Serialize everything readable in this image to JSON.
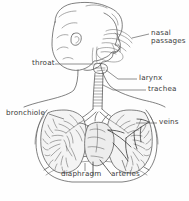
{
  "figure": {
    "style": "pencil line drawing",
    "background_color": "#fefefe",
    "ink_color": "#4a4a4a",
    "label_color": "#3a3a3a",
    "caption": ""
  },
  "labels": {
    "nasal_passages": "nasal\npassages",
    "nasal_passages_line1": "nasal",
    "nasal_passages_line2": "passages",
    "throat": "throat",
    "larynx": "larynx",
    "trachea": "trachea",
    "bronchiole": "bronchiole",
    "veins": "veins",
    "diaphragm": "diaphragm",
    "arteries": "arteries"
  },
  "parts": [
    {
      "id": "nasal-passages",
      "label": "nasal passages",
      "side": "right",
      "x": 152,
      "y": 34
    },
    {
      "id": "throat",
      "label": "throat",
      "side": "left",
      "x": 30,
      "y": 62
    },
    {
      "id": "larynx",
      "label": "larynx",
      "side": "right",
      "x": 140,
      "y": 77
    },
    {
      "id": "trachea",
      "label": "trachea",
      "side": "right",
      "x": 149,
      "y": 89
    },
    {
      "id": "bronchiole",
      "label": "bronchiole",
      "side": "left",
      "x": 8,
      "y": 113
    },
    {
      "id": "veins",
      "label": "veins",
      "side": "right",
      "x": 160,
      "y": 122
    },
    {
      "id": "diaphragm",
      "label": "diaphragm",
      "side": "bottom",
      "x": 62,
      "y": 174
    },
    {
      "id": "arteries",
      "label": "arteries",
      "side": "bottom",
      "x": 112,
      "y": 174
    }
  ]
}
